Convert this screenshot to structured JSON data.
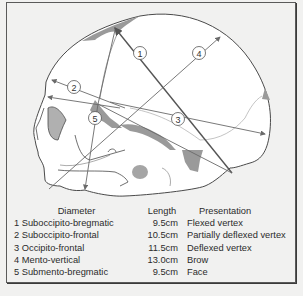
{
  "figure": {
    "type": "Fetal skull diameters diagram (lateral view)",
    "labels": [
      {
        "id": "1",
        "label": "1"
      },
      {
        "id": "2",
        "label": "2"
      },
      {
        "id": "3",
        "label": "3"
      },
      {
        "id": "4",
        "label": "4"
      },
      {
        "id": "5",
        "label": "5"
      }
    ],
    "colors": {
      "background": "#f1f1f0",
      "skull_fill": "#ffffff",
      "outline": "#4a4a4a",
      "shading": "#9a9a9a",
      "arrow": "#6a6a6a"
    }
  },
  "table": {
    "headers": {
      "diameter": "Diameter",
      "length": "Length",
      "presentation": "Presentation"
    },
    "rows": [
      {
        "diameter": "1 Suboccipito-bregmatic",
        "length": "9.5cm",
        "presentation": "Flexed vertex"
      },
      {
        "diameter": "2 Suboccipito-frontal",
        "length": "10.5cm",
        "presentation": "Partially deflexed vertex"
      },
      {
        "diameter": "3 Occipito-frontal",
        "length": "11.5cm",
        "presentation": "Deflexed vertex"
      },
      {
        "diameter": "4 Mento-vertical",
        "length": "13.0cm",
        "presentation": "Brow"
      },
      {
        "diameter": "5 Submento-bregmatic",
        "length": "9.5cm",
        "presentation": "Face"
      }
    ]
  }
}
